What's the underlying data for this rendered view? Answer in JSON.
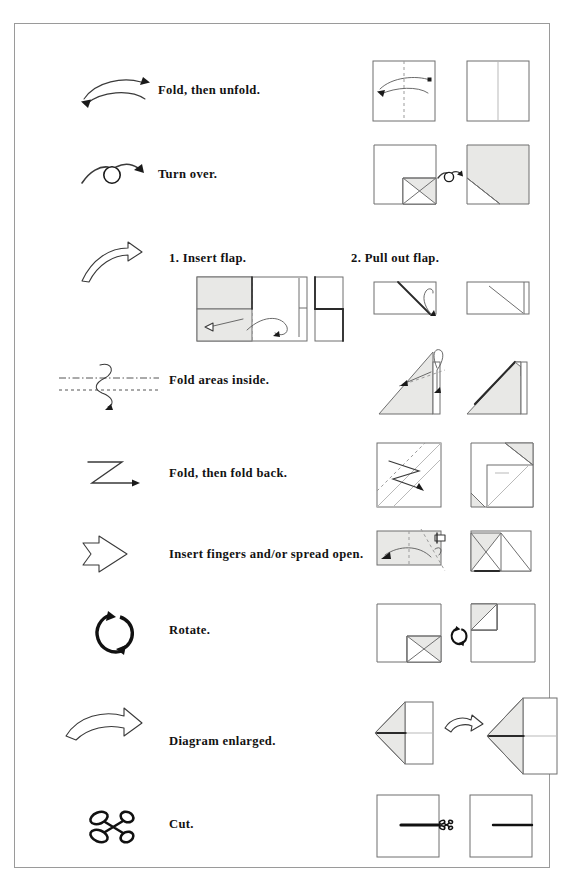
{
  "page": {
    "kind": "origami-symbols-reference",
    "background": "#ffffff",
    "frame_color": "#9a9a9a",
    "ink_color": "#111111",
    "paper_fill": "#ffffff",
    "shade_fill": "#e8e8e6"
  },
  "rows": [
    {
      "id": "fold-then-unfold",
      "symbol_name": "double-headed-curved-arrow-icon",
      "label": "Fold, then unfold.",
      "label2": null,
      "diagram_name": "fold-unfold-diagram",
      "panels": [
        {
          "name": "square-with-dashed-center-and-fold-unfold-arrow"
        },
        {
          "name": "square-with-solid-crease-line"
        }
      ]
    },
    {
      "id": "turn-over",
      "symbol_name": "turn-over-loop-arrow-icon",
      "label": "Turn over.",
      "label2": null,
      "diagram_name": "turn-over-diagram",
      "panels": [
        {
          "name": "square-with-shaded-folded-corner"
        },
        {
          "name": "mirrored-square-with-shaded-folded-corner"
        }
      ]
    },
    {
      "id": "insert-pull-flap",
      "symbol_name": "hollow-curved-arrow-icon",
      "label": "1. Insert flap.",
      "label2": "2. Pull out flap.",
      "diagram_name": "insert-flap-diagram",
      "diagram_name2": "pull-out-flap-diagram",
      "panels": [
        {
          "name": "open-model-with-insert-arrow"
        },
        {
          "name": "closed-model-after-insert"
        },
        {
          "name": "flat-model-with-pull-out-arrow"
        },
        {
          "name": "flat-model-after-pull-out"
        }
      ]
    },
    {
      "id": "fold-areas-inside",
      "symbol_name": "s-curve-arrow-between-fold-lines-icon",
      "label": "Fold areas inside.",
      "label2": null,
      "diagram_name": "fold-areas-inside-diagram",
      "panels": [
        {
          "name": "triangle-model-with-inside-fold-arrow"
        },
        {
          "name": "triangle-model-after-inside-fold"
        }
      ]
    },
    {
      "id": "fold-then-fold-back",
      "symbol_name": "zigzag-z-arrow-icon",
      "label": "Fold, then fold back.",
      "label2": null,
      "diagram_name": "fold-fold-back-diagram",
      "panels": [
        {
          "name": "square-with-pleat-creases"
        },
        {
          "name": "square-after-pleat-fold"
        }
      ]
    },
    {
      "id": "insert-fingers-spread-open",
      "symbol_name": "hollow-block-arrow-icon",
      "label": "Insert fingers and/or spread open.",
      "label2": null,
      "diagram_name": "spread-open-diagram",
      "panels": [
        {
          "name": "rectangle-with-spread-arrow"
        },
        {
          "name": "spread-open-result"
        }
      ]
    },
    {
      "id": "rotate",
      "symbol_name": "rotate-circular-arrows-icon",
      "label": "Rotate.",
      "label2": null,
      "diagram_name": "rotate-diagram",
      "panels": [
        {
          "name": "square-before-rotation"
        },
        {
          "name": "rotate-marker"
        },
        {
          "name": "square-after-rotation"
        }
      ]
    },
    {
      "id": "diagram-enlarged",
      "symbol_name": "hollow-swoosh-arrow-icon",
      "label": "Diagram enlarged.",
      "label2": null,
      "diagram_name": "enlarge-diagram",
      "panels": [
        {
          "name": "small-model"
        },
        {
          "name": "enlarge-arrow"
        },
        {
          "name": "enlarged-model"
        }
      ]
    },
    {
      "id": "cut",
      "symbol_name": "scissors-icon",
      "label": "Cut.",
      "label2": null,
      "diagram_name": "cut-diagram",
      "panels": [
        {
          "name": "square-with-cut-line-and-scissors"
        },
        {
          "name": "square-after-cut"
        }
      ]
    }
  ]
}
